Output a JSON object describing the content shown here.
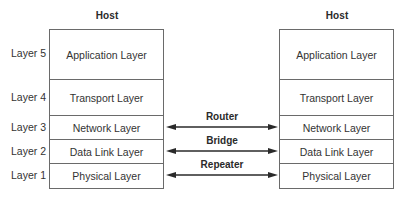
{
  "hosts": [
    {
      "title": "Host",
      "side": "left"
    },
    {
      "title": "Host",
      "side": "right"
    }
  ],
  "layer_numbers": [
    "Layer 5",
    "Layer 4",
    "Layer 3",
    "Layer 2",
    "Layer 1"
  ],
  "layers": [
    {
      "name": "Application Layer",
      "height": 50
    },
    {
      "name": "Transport Layer",
      "height": 36
    },
    {
      "name": "Network Layer",
      "height": 24
    },
    {
      "name": "Data Link Layer",
      "height": 24
    },
    {
      "name": "Physical Layer",
      "height": 24
    }
  ],
  "connections": [
    {
      "label": "Router",
      "layer": "Network Layer"
    },
    {
      "label": "Bridge",
      "layer": "Data Link Layer"
    },
    {
      "label": "Repeater",
      "layer": "Physical Layer"
    }
  ],
  "colors": {
    "line": "#6a6a6a",
    "arrow": "#2a2a2a",
    "text": "#333333"
  }
}
